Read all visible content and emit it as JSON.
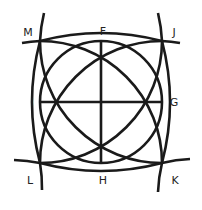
{
  "diagram": {
    "type": "geometric-construction",
    "stroke_color": "#1a1a1a",
    "center": [
      101,
      102
    ],
    "radius": 61,
    "points": {
      "F": {
        "label": "F",
        "x": 101,
        "y": 41,
        "label_x": 103,
        "label_y": 31
      },
      "G": {
        "label": "G",
        "x": 162,
        "y": 102,
        "label_x": 174,
        "label_y": 102
      },
      "H": {
        "label": "H",
        "x": 101,
        "y": 163,
        "label_x": 103,
        "label_y": 180
      },
      "I": {
        "label": "I",
        "x": 40,
        "y": 102,
        "label_x": 32,
        "label_y": 102
      },
      "J": {
        "label": "J",
        "x": 162,
        "y": 41,
        "label_x": 174,
        "label_y": 32
      },
      "K": {
        "label": "K",
        "x": 162,
        "y": 163,
        "label_x": 175,
        "label_y": 180
      },
      "L": {
        "label": "L",
        "x": 40,
        "y": 163,
        "label_x": 30,
        "label_y": 180
      },
      "M": {
        "label": "M",
        "x": 40,
        "y": 41,
        "label_x": 28,
        "label_y": 32
      }
    }
  }
}
